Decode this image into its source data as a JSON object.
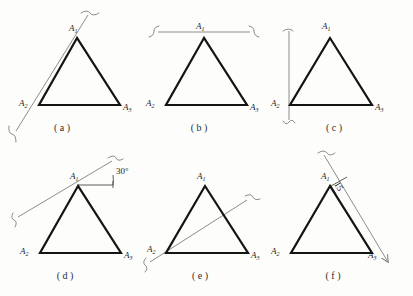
{
  "sheet": {
    "background_color": "#fdfdfb",
    "triangle_stroke_color": "#141414",
    "aux_line_color": "#6f6f6f",
    "text_color": "#1c1c1c",
    "rows": 2,
    "columns": 3
  },
  "vertex_labels": {
    "apex": "A",
    "apex_sub": "1",
    "left": "A",
    "left_sub": "2",
    "right": "A",
    "right_sub": "3"
  },
  "figures": [
    {
      "id": "a",
      "caption": "( a )",
      "annotation_type": "oblique-line-through-apex-and-left-vertex",
      "endpoint_marker": "s-curve-tick",
      "dimension_text": ""
    },
    {
      "id": "b",
      "caption": "( b )",
      "annotation_type": "horizontal-line-above-apex",
      "endpoint_marker": "s-curve-tick",
      "dimension_text": ""
    },
    {
      "id": "c",
      "caption": "( c )",
      "annotation_type": "vertical-line-through-left-vertex",
      "endpoint_marker": "s-curve-tick",
      "dimension_text": ""
    },
    {
      "id": "d",
      "caption": "( d )",
      "annotation_type": "inclined-line-through-apex-with-angle",
      "endpoint_marker": "s-curve-tick",
      "dimension_text": "30°"
    },
    {
      "id": "e",
      "caption": "( e )",
      "annotation_type": "inclined-line-through-left-vertex",
      "endpoint_marker": "s-curve-tick",
      "dimension_text": ""
    },
    {
      "id": "f",
      "caption": "( f )",
      "annotation_type": "offset-line-from-apex-with-distance",
      "endpoint_marker": "arrowhead",
      "dimension_text": "15"
    }
  ]
}
